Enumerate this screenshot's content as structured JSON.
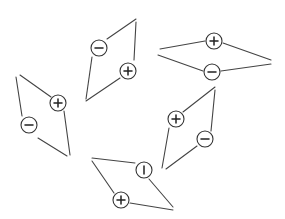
{
  "diagram": {
    "colors": {
      "background": "#ffffff",
      "line": "#444444",
      "circle_stroke": "#333333",
      "glyph": "#222222"
    },
    "charge_radius": 8,
    "shapes": [
      {
        "id": "shape-top-center",
        "edges": [
          [
            107,
            39,
            136,
            19
          ],
          [
            136,
            22,
            134,
            60
          ],
          [
            120,
            78,
            86,
            101
          ],
          [
            92,
            57,
            86,
            99
          ]
        ],
        "charges": [
          {
            "symbol": "minus",
            "x": 99,
            "y": 48
          },
          {
            "symbol": "plus",
            "x": 128,
            "y": 71
          }
        ]
      },
      {
        "id": "shape-top-right",
        "edges": [
          [
            160,
            49,
            205,
            41
          ],
          [
            223,
            43,
            271,
            60
          ],
          [
            158,
            55,
            203,
            71
          ],
          [
            221,
            71,
            271,
            64
          ]
        ],
        "charges": [
          {
            "symbol": "plus",
            "x": 214,
            "y": 41
          },
          {
            "symbol": "minus",
            "x": 212,
            "y": 72
          }
        ]
      },
      {
        "id": "shape-left",
        "edges": [
          [
            20,
            75,
            51,
            97
          ],
          [
            16,
            77,
            22,
            116
          ],
          [
            64,
            111,
            70,
            155
          ],
          [
            38,
            138,
            67,
            156
          ]
        ],
        "charges": [
          {
            "symbol": "plus",
            "x": 58,
            "y": 103
          },
          {
            "symbol": "minus",
            "x": 29,
            "y": 125
          }
        ]
      },
      {
        "id": "shape-bottom",
        "edges": [
          [
            92,
            158,
            135,
            163
          ],
          [
            92,
            161,
            114,
            193
          ],
          [
            149,
            179,
            173,
            207
          ],
          [
            130,
            203,
            173,
            210
          ]
        ],
        "charges": [
          {
            "symbol": "bar",
            "x": 144,
            "y": 170
          },
          {
            "symbol": "plus",
            "x": 121,
            "y": 200
          }
        ]
      },
      {
        "id": "shape-right-middle",
        "edges": [
          [
            183,
            112,
            215,
            87
          ],
          [
            215,
            90,
            211,
            131
          ],
          [
            197,
            146,
            166,
            169
          ],
          [
            169,
            128,
            162,
            168
          ]
        ],
        "charges": [
          {
            "symbol": "plus",
            "x": 176,
            "y": 119
          },
          {
            "symbol": "minus",
            "x": 205,
            "y": 139
          }
        ]
      }
    ]
  }
}
